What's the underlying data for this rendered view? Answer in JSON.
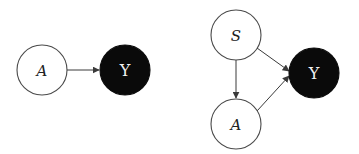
{
  "diagrams": [
    {
      "name": "simple-dag",
      "nodes": [
        {
          "id": "A",
          "label": "A",
          "style": "open",
          "cx": 42,
          "cy": 70,
          "r": 25
        },
        {
          "id": "Y",
          "label": "Y",
          "style": "filled",
          "cx": 125,
          "cy": 70,
          "r": 25
        }
      ],
      "edges": [
        {
          "from": "A",
          "to": "Y"
        }
      ]
    },
    {
      "name": "confounded-dag",
      "nodes": [
        {
          "id": "S",
          "label": "S",
          "style": "open",
          "cx": 236,
          "cy": 35,
          "r": 25
        },
        {
          "id": "A",
          "label": "A",
          "style": "open",
          "cx": 236,
          "cy": 124,
          "r": 25
        },
        {
          "id": "Y",
          "label": "Y",
          "style": "filled",
          "cx": 314,
          "cy": 73,
          "r": 25
        }
      ],
      "edges": [
        {
          "from": "S",
          "to": "A"
        },
        {
          "from": "S",
          "to": "Y"
        },
        {
          "from": "A",
          "to": "Y"
        }
      ]
    }
  ],
  "colors": {
    "open_fill": "#ffffff",
    "open_stroke": "#4a4a4a",
    "filled_fill": "#0a0a0a",
    "filled_label": "#f2f2f2",
    "edge": "#3a3a3a"
  }
}
